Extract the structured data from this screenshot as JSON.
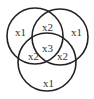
{
  "diagram": {
    "type": "venn",
    "circles": [
      {
        "name": "top-left",
        "cx": 35,
        "cy": 36,
        "r": 28
      },
      {
        "name": "top-right",
        "cx": 60,
        "cy": 37,
        "r": 28
      },
      {
        "name": "bottom",
        "cx": 47,
        "cy": 62,
        "r": 29
      }
    ],
    "regions": [
      {
        "name": "left-only",
        "label": "x1",
        "x": 15,
        "y": 36
      },
      {
        "name": "right-only",
        "label": "x1",
        "x": 71,
        "y": 36
      },
      {
        "name": "bottom-only",
        "label": "x1",
        "x": 43,
        "y": 87
      },
      {
        "name": "top-overlap",
        "label": "x2",
        "x": 42,
        "y": 31
      },
      {
        "name": "left-bottom-overlap",
        "label": "x2",
        "x": 28,
        "y": 60
      },
      {
        "name": "right-bottom-overlap",
        "label": "x2",
        "x": 57,
        "y": 60
      },
      {
        "name": "center-overlap",
        "label": "x3",
        "x": 42,
        "y": 52
      }
    ]
  }
}
